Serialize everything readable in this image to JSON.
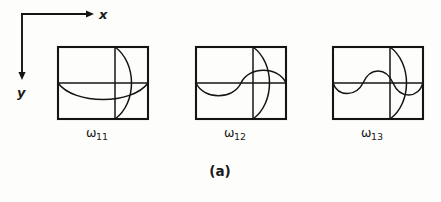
{
  "figure": {
    "caption": "(a)",
    "background_color": "#fdfdfc",
    "ink_color": "#141414",
    "axes": {
      "x_label": "x",
      "y_label": "y",
      "x_direction": "right",
      "y_direction": "down",
      "origin": {
        "x": 22,
        "y": 14
      },
      "x_arrow_tip": {
        "x": 92,
        "y": 14
      },
      "y_arrow_tip": {
        "x": 22,
        "y": 78
      }
    },
    "panels": [
      {
        "label_symbol": "ω",
        "label_subscript": "11",
        "label_full": "ω₁₁",
        "box": {
          "x": 58,
          "y": 47,
          "width": 90,
          "height": 72
        },
        "horizontal_half_waves": 1,
        "vertical_half_waves": 1,
        "horizontal_nodal_line": true,
        "vertical_nodal_line": true,
        "horizontal_curve_direction": "down",
        "vertical_curve_direction": "right"
      },
      {
        "label_symbol": "ω",
        "label_subscript": "12",
        "label_full": "ω₁₂",
        "box": {
          "x": 196,
          "y": 47,
          "width": 90,
          "height": 72
        },
        "horizontal_half_waves": 2,
        "vertical_half_waves": 1,
        "horizontal_nodal_line": true,
        "vertical_nodal_line": true,
        "horizontal_curve_direction": "down",
        "vertical_curve_direction": "right"
      },
      {
        "label_symbol": "ω",
        "label_subscript": "13",
        "label_full": "ω₁₃",
        "box": {
          "x": 333,
          "y": 47,
          "width": 90,
          "height": 72
        },
        "horizontal_half_waves": 3,
        "vertical_half_waves": 1,
        "horizontal_nodal_line": true,
        "vertical_nodal_line": true,
        "horizontal_curve_direction": "down",
        "vertical_curve_direction": "right"
      }
    ]
  }
}
